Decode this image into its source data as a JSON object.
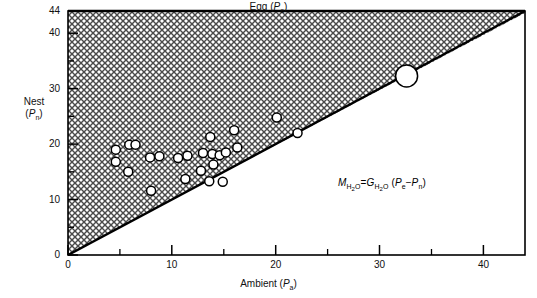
{
  "figure": {
    "type": "scatter",
    "top_axis_label": "Egg (Pe)",
    "y_axis_label_line1": "Nest",
    "y_axis_label_line2": "(Pn)",
    "x_axis_label": "Ambient (Pa)",
    "equation": "MH2O = GH2O (Pe - Pn)",
    "equation_parts": {
      "lhs_var": "M",
      "lhs_sub": "H2O",
      "eq": "=",
      "rhs_var": "G",
      "rhs_sub": "H2O",
      "open": "(",
      "term1_var": "P",
      "term1_sub": "e",
      "minus": "−",
      "term2_var": "P",
      "term2_sub": "n",
      "close": ")"
    },
    "colors": {
      "line": "#000000",
      "frame": "#000000",
      "fill_hatch": "#3a3a3a",
      "marker_face": "#ffffff",
      "marker_edge": "#000000",
      "background": "#ffffff"
    }
  },
  "chart_data": {
    "type": "scatter",
    "title": "",
    "xlabel": "Ambient (Pa)",
    "ylabel": "Nest (Pn)",
    "top_label": "Egg (Pe)",
    "xlim": [
      0,
      44
    ],
    "ylim": [
      0,
      44
    ],
    "xticks": [
      0,
      10,
      20,
      30,
      40
    ],
    "yticks": [
      0,
      10,
      20,
      30,
      40,
      44
    ],
    "xtick_labels": [
      "0",
      "10",
      "20",
      "30",
      "40"
    ],
    "ytick_labels": [
      "0",
      "10",
      "20",
      "30",
      "40",
      "44"
    ],
    "minor_tick_interval": 5,
    "grid": false,
    "legend": null,
    "annotations": [
      {
        "text": "MH2O = GH2O (Pe - Pn)",
        "x": 24.5,
        "y": 15.0
      }
    ],
    "reference_line": {
      "name": "identity-line",
      "description": "Pn = Pa diagonal; shaded region above indicates Pe > Pn",
      "from": [
        0,
        0
      ],
      "to": [
        44,
        44
      ],
      "shaded_above": true,
      "shading": "crosshatch"
    },
    "series": [
      {
        "name": "Nest humidity observations",
        "marker": "open-circle",
        "marker_size": 9,
        "points": [
          {
            "x": 4.6,
            "y": 19.0
          },
          {
            "x": 4.6,
            "y": 16.8
          },
          {
            "x": 5.9,
            "y": 19.9
          },
          {
            "x": 6.5,
            "y": 19.9
          },
          {
            "x": 5.8,
            "y": 15.0
          },
          {
            "x": 7.9,
            "y": 17.6
          },
          {
            "x": 8.8,
            "y": 17.8
          },
          {
            "x": 8.0,
            "y": 11.6
          },
          {
            "x": 10.6,
            "y": 17.5
          },
          {
            "x": 11.5,
            "y": 17.9
          },
          {
            "x": 11.3,
            "y": 13.7
          },
          {
            "x": 13.0,
            "y": 18.4
          },
          {
            "x": 12.8,
            "y": 15.2
          },
          {
            "x": 13.7,
            "y": 21.3
          },
          {
            "x": 13.9,
            "y": 18.2
          },
          {
            "x": 14.0,
            "y": 16.3
          },
          {
            "x": 13.6,
            "y": 13.3
          },
          {
            "x": 14.6,
            "y": 18.0
          },
          {
            "x": 15.2,
            "y": 18.5
          },
          {
            "x": 16.0,
            "y": 22.5
          },
          {
            "x": 16.3,
            "y": 19.4
          },
          {
            "x": 20.1,
            "y": 24.8
          },
          {
            "x": 14.9,
            "y": 13.2
          },
          {
            "x": 22.1,
            "y": 22.0
          }
        ]
      },
      {
        "name": "Large observation",
        "marker": "open-circle",
        "marker_size": 22,
        "points": [
          {
            "x": 32.6,
            "y": 32.3
          }
        ]
      }
    ]
  }
}
